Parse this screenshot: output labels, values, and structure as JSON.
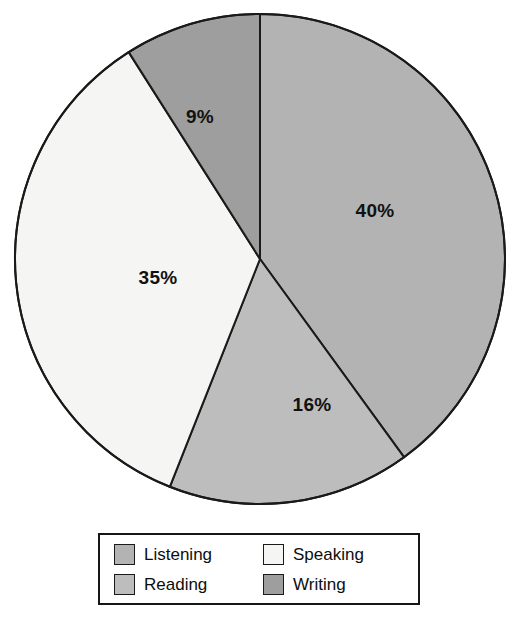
{
  "chart_data": {
    "type": "pie",
    "title": "",
    "subtitle": "",
    "xlabel": "",
    "ylabel": "",
    "categories": [
      "Listening",
      "Speaking",
      "Reading",
      "Writing"
    ],
    "values": [
      40,
      35,
      16,
      9
    ],
    "unit": "%",
    "legend_position": "bottom",
    "legend_columns": 2,
    "grid": false,
    "start_angle_deg": 0,
    "direction": "clockwise",
    "slices": [
      {
        "name": "Listening",
        "value": 40,
        "label": "40%",
        "color": "#b3b3b3",
        "start_deg": 0,
        "end_deg": 144,
        "label_x": 375,
        "label_y": 212
      },
      {
        "name": "Reading",
        "value": 16,
        "label": "16%",
        "color": "#bdbdbd",
        "start_deg": 144,
        "end_deg": 201.6,
        "label_x": 312,
        "label_y": 406
      },
      {
        "name": "Speaking",
        "value": 35,
        "label": "35%",
        "color": "#f5f5f3",
        "start_deg": 201.6,
        "end_deg": 327.6,
        "label_x": 158,
        "label_y": 279
      },
      {
        "name": "Writing",
        "value": 9,
        "label": "9%",
        "color": "#9e9e9e",
        "start_deg": 327.6,
        "end_deg": 360,
        "label_x": 200,
        "label_y": 118
      }
    ]
  },
  "pie": {
    "center_x": 260,
    "center_y": 259,
    "radius": 245,
    "outline_color": "#1a1a1a",
    "outline_width": 2
  },
  "labels": {
    "listening_pct": "40%",
    "reading_pct": "16%",
    "speaking_pct": "35%",
    "writing_pct": "9%"
  },
  "legend": {
    "border_color": "#161616",
    "background": "#ffffff",
    "items": [
      {
        "label": "Listening",
        "color": "#b3b3b3"
      },
      {
        "label": "Speaking",
        "color": "#f5f5f3"
      },
      {
        "label": "Reading",
        "color": "#bdbdbd"
      },
      {
        "label": "Writing",
        "color": "#9e9e9e"
      }
    ]
  }
}
